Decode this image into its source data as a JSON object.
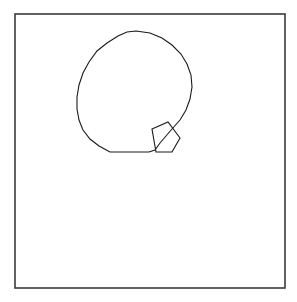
{
  "document": {
    "title": "Geometric Line Drawing",
    "background_color": "#ffffff",
    "width": 297,
    "height": 302
  },
  "frame": {
    "name": "outer-border-rectangle",
    "x": 15,
    "y": 14,
    "width": 270,
    "height": 274,
    "stroke_color": "#3a3a3a",
    "stroke_width": 1.6,
    "fill": "none"
  },
  "shapes": [
    {
      "name": "large-polygon",
      "description": "many-sided polygon approximating a circle with a flat bottom chord",
      "stroke_color": "#1a1a1a",
      "stroke_width": 1.1,
      "fill": "none",
      "closed": true,
      "vertex_count": 20,
      "points": "136,31 150,33 162,38 172,45 181,54 187,64 191,75 192,87 190,99 186,110 180,120 172,129 166,136 160,143 155,150 149,152 110,152 99,146 90,139 83,130 79,120 77,109 77,97 79,85 83,73 89,62 97,51 107,43 118,36 127,32"
    },
    {
      "name": "small-quadrilateral",
      "description": "small tilted quadrilateral overlapping the lower-right of the large polygon",
      "stroke_color": "#1a1a1a",
      "stroke_width": 1.1,
      "fill": "none",
      "closed": true,
      "vertex_count": 5,
      "points": "152,129 168,122 180,138 172,152 156,152"
    }
  ],
  "colors": {
    "background": "#ffffff",
    "frame_stroke": "#3a3a3a",
    "figure_stroke": "#1a1a1a"
  },
  "labels": {
    "figure_label": "",
    "caption": ""
  }
}
